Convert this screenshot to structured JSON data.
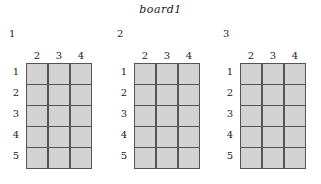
{
  "title": "board1",
  "colors": {
    "cell_fill": "#d3d3d3",
    "grid_line": "#555555"
  },
  "boards": [
    {
      "label": "1",
      "columns": [
        "2",
        "3",
        "4"
      ],
      "rows": [
        "1",
        "2",
        "3",
        "4",
        "5"
      ]
    },
    {
      "label": "2",
      "columns": [
        "2",
        "3",
        "4"
      ],
      "rows": [
        "1",
        "2",
        "3",
        "4",
        "5"
      ]
    },
    {
      "label": "3",
      "columns": [
        "2",
        "3",
        "4"
      ],
      "rows": [
        "1",
        "2",
        "3",
        "4",
        "5"
      ]
    }
  ]
}
